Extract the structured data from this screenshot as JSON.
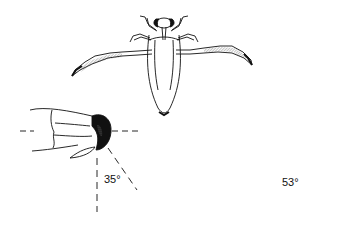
{
  "figure": {
    "panels": [
      {
        "id": "insect-top-view",
        "label": ""
      },
      {
        "id": "joint-left",
        "angle_label": "35°",
        "angle_value": 35
      },
      {
        "id": "joint-right",
        "angle_label": "53°",
        "angle_value": 53
      }
    ],
    "colors": {
      "ink": "#111111",
      "background": "#ffffff"
    }
  }
}
